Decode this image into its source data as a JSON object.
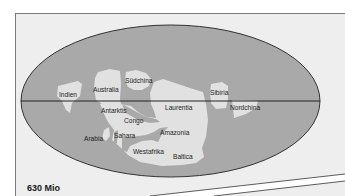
{
  "figure": {
    "time_label": "630 Mio",
    "colors": {
      "ocean": "#a9a9a9",
      "land": "#e1e1e1",
      "frame_bg": "#eeeeee",
      "outline": "#333333"
    },
    "map": {
      "projection": "ellipse",
      "has_equator_line": true,
      "labels": {
        "indien": "Indien",
        "australia": "Australia",
        "suedchina": "Südchina",
        "sibiria": "Sibiria",
        "nordchina": "Nordchina",
        "antarktis": "Antarktis",
        "laurentia": "Laurentia",
        "congo": "Congo",
        "arabia": "Arabia",
        "sahara": "Sahara",
        "amazonia": "Amazonia",
        "westafrika": "Westafrika",
        "baltica": "Baltica"
      }
    }
  }
}
